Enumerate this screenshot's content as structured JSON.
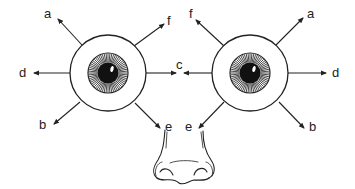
{
  "diagram": {
    "colors": {
      "stroke": "#222222",
      "background": "#ffffff",
      "pupil": "#111111"
    },
    "left_eye": {
      "labels": {
        "a": "a",
        "f": "f",
        "d": "d",
        "c": "c",
        "b": "b",
        "e": "e"
      }
    },
    "right_eye": {
      "labels": {
        "f": "f",
        "a": "a",
        "c": "c",
        "d": "d",
        "e": "e",
        "b": "b"
      }
    },
    "shared_label_c": "c",
    "nose": "nose"
  }
}
